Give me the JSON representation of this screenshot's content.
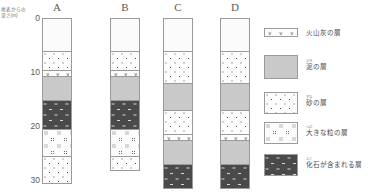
{
  "axis": {
    "caption": "地表からの深さ(m)",
    "caption_line1": "地表からの",
    "caption_line2": "深さ(m)",
    "unit": "m",
    "ticks": [
      {
        "label": "0",
        "value": 0
      },
      {
        "label": "10",
        "value": 10
      },
      {
        "label": "20",
        "value": 20
      },
      {
        "label": "30",
        "value": 30
      }
    ],
    "range": [
      0,
      30
    ]
  },
  "columns": [
    {
      "letter": "A",
      "layers": [
        {
          "type": "blank",
          "top_m": 0.0,
          "bottom_m": 6.1
        },
        {
          "type": "sand",
          "top_m": 6.1,
          "bottom_m": 9.6
        },
        {
          "type": "ash",
          "top_m": 9.6,
          "bottom_m": 10.7
        },
        {
          "type": "mud",
          "top_m": 10.7,
          "bottom_m": 15.2
        },
        {
          "type": "fossil",
          "top_m": 15.2,
          "bottom_m": 20.4
        },
        {
          "type": "coarse",
          "top_m": 20.4,
          "bottom_m": 25.4
        },
        {
          "type": "sand",
          "top_m": 25.4,
          "bottom_m": 30.6
        }
      ]
    },
    {
      "letter": "B",
      "layers": [
        {
          "type": "blank",
          "top_m": 0.0,
          "bottom_m": 6.1
        },
        {
          "type": "sand",
          "top_m": 6.1,
          "bottom_m": 9.6
        },
        {
          "type": "ash",
          "top_m": 9.6,
          "bottom_m": 10.7
        },
        {
          "type": "mud",
          "top_m": 10.7,
          "bottom_m": 15.2
        },
        {
          "type": "fossil",
          "top_m": 15.2,
          "bottom_m": 20.4
        },
        {
          "type": "coarse",
          "top_m": 20.4,
          "bottom_m": 25.4
        },
        {
          "type": "sand",
          "top_m": 25.4,
          "bottom_m": 28.3
        }
      ]
    },
    {
      "letter": "C",
      "layers": [
        {
          "type": "blank",
          "top_m": 0.0,
          "bottom_m": 6.1
        },
        {
          "type": "sand",
          "top_m": 6.1,
          "bottom_m": 12.0
        },
        {
          "type": "mud",
          "top_m": 12.0,
          "bottom_m": 17.0
        },
        {
          "type": "sand",
          "top_m": 17.0,
          "bottom_m": 21.4
        },
        {
          "type": "ash",
          "top_m": 21.4,
          "bottom_m": 22.6
        },
        {
          "type": "mud",
          "top_m": 22.6,
          "bottom_m": 27.0
        },
        {
          "type": "fossil",
          "top_m": 27.0,
          "bottom_m": 31.5
        }
      ]
    },
    {
      "letter": "D",
      "layers": [
        {
          "type": "blank",
          "top_m": 0.0,
          "bottom_m": 6.1
        },
        {
          "type": "sand",
          "top_m": 6.1,
          "bottom_m": 12.0
        },
        {
          "type": "mud",
          "top_m": 12.0,
          "bottom_m": 17.0
        },
        {
          "type": "sand",
          "top_m": 17.0,
          "bottom_m": 21.4
        },
        {
          "type": "ash",
          "top_m": 21.4,
          "bottom_m": 22.6
        },
        {
          "type": "mud",
          "top_m": 22.6,
          "bottom_m": 27.0
        },
        {
          "type": "fossil",
          "top_m": 27.0,
          "bottom_m": 31.5
        }
      ]
    }
  ],
  "legend": {
    "items": [
      {
        "type": "ash",
        "label": "火山灰の層",
        "ruby": ""
      },
      {
        "type": "mud",
        "label": "泥の層",
        "ruby": "どろ"
      },
      {
        "type": "sand",
        "label": "砂の層",
        "ruby": "すな"
      },
      {
        "type": "coarse",
        "label": "大きな粒の層",
        "ruby": "つぶ"
      },
      {
        "type": "fossil",
        "label": "化石が含まれる層",
        "ruby": "ふく"
      }
    ]
  },
  "ash_glyph": "∨",
  "colors": {
    "mud": "#c9c9c9",
    "fossil": "#4a4a4a",
    "outline": "#9a9a9a",
    "text": "#4a4a4a"
  }
}
